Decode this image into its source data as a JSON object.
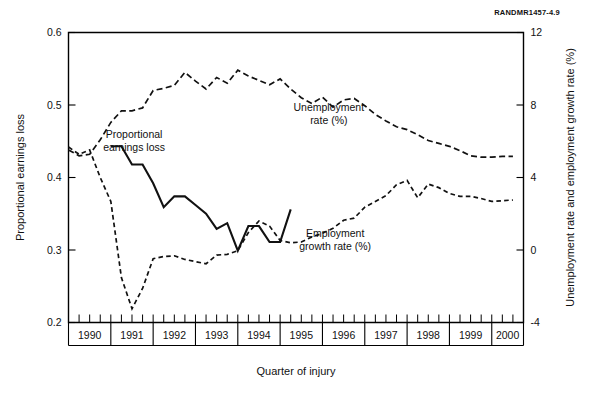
{
  "figure": {
    "number_note": "RANDMR1457-4.9"
  },
  "chart_data": {
    "type": "line",
    "title": "",
    "xlabel": "Quarter of injury",
    "ylabel": "Proportional earnings loss",
    "y2label": "Unemployment rate and employment growth rate (%)",
    "grid": false,
    "legend_position": "inline-annotations",
    "xlim": [
      1990.0,
      2000.75
    ],
    "ylim": [
      0.2,
      0.6
    ],
    "y2lim": [
      -4,
      12
    ],
    "yticks": [
      0.2,
      0.3,
      0.4,
      0.5,
      0.6
    ],
    "ytick_labels": [
      "0.2",
      "0.3",
      "0.4",
      "0.5",
      "0.6"
    ],
    "y2ticks": [
      -4,
      0,
      4,
      8,
      12
    ],
    "y2tick_labels": [
      "-4",
      "0",
      "4",
      "8",
      "12"
    ],
    "x_year_labels": [
      "1990",
      "1991",
      "1992",
      "1993",
      "1994",
      "1995",
      "1996",
      "1997",
      "1998",
      "1999",
      "2000"
    ],
    "x_minor_ticks_per_year": 4,
    "annotations": [
      {
        "text_line1": "Unemployment",
        "text_line2": "rate (%)",
        "x": 1996.15,
        "y_left": 0.492
      },
      {
        "text_line1": "Proportional",
        "text_line2": "earnings loss",
        "x": 1991.55,
        "y_left": 0.455
      },
      {
        "text_line1": "Employment",
        "text_line2": "growth rate (%)",
        "x": 1996.3,
        "y_left": 0.318
      }
    ],
    "series": [
      {
        "name": "Proportional earnings loss",
        "style": "solid",
        "axis": "left",
        "x": [
          1991.0,
          1991.25,
          1991.5,
          1991.75,
          1992.0,
          1992.25,
          1992.5,
          1992.75,
          1993.0,
          1993.25,
          1993.5,
          1993.75,
          1994.0,
          1994.25,
          1994.5,
          1994.75,
          1995.0,
          1995.25
        ],
        "values": [
          0.443,
          0.443,
          0.418,
          0.418,
          0.392,
          0.359,
          0.374,
          0.374,
          0.362,
          0.35,
          0.329,
          0.337,
          0.299,
          0.333,
          0.333,
          0.311,
          0.311,
          0.356
        ]
      },
      {
        "name": "Unemployment rate (%)",
        "style": "dashed",
        "axis": "right",
        "x": [
          1990.0,
          1990.25,
          1990.5,
          1990.75,
          1991.0,
          1991.25,
          1991.5,
          1991.75,
          1992.0,
          1992.25,
          1992.5,
          1992.75,
          1993.0,
          1993.25,
          1993.5,
          1993.75,
          1994.0,
          1994.25,
          1994.5,
          1994.75,
          1995.0,
          1995.25,
          1995.5,
          1995.75,
          1996.0,
          1996.25,
          1996.5,
          1996.75,
          1997.0,
          1997.25,
          1997.5,
          1997.75,
          1998.0,
          1998.25,
          1998.5,
          1998.75,
          1999.0,
          1999.25,
          1999.5,
          1999.75,
          2000.0,
          2000.25,
          2000.5
        ],
        "values_left_scale": [
          0.438,
          0.43,
          0.432,
          0.452,
          0.476,
          0.492,
          0.492,
          0.496,
          0.52,
          0.523,
          0.527,
          0.545,
          0.533,
          0.522,
          0.538,
          0.53,
          0.548,
          0.54,
          0.534,
          0.528,
          0.536,
          0.522,
          0.51,
          0.502,
          0.511,
          0.497,
          0.507,
          0.509,
          0.499,
          0.487,
          0.478,
          0.47,
          0.466,
          0.459,
          0.451,
          0.447,
          0.443,
          0.437,
          0.43,
          0.428,
          0.428,
          0.429,
          0.429
        ],
        "values": [
          5.5,
          5.2,
          5.3,
          6.1,
          7.0,
          7.7,
          7.7,
          7.8,
          8.8,
          8.9,
          9.1,
          9.8,
          9.3,
          8.9,
          9.5,
          9.2,
          9.9,
          9.6,
          9.4,
          9.1,
          9.4,
          8.9,
          8.4,
          8.1,
          8.4,
          7.9,
          8.3,
          8.4,
          8.0,
          7.5,
          7.1,
          6.8,
          6.6,
          6.4,
          6.0,
          5.9,
          5.7,
          5.5,
          5.2,
          5.1,
          5.1,
          5.2,
          5.2
        ]
      },
      {
        "name": "Employment growth rate (%)",
        "style": "dashed-fine",
        "axis": "right",
        "x": [
          1990.0,
          1990.25,
          1990.5,
          1990.75,
          1991.0,
          1991.25,
          1991.5,
          1991.75,
          1992.0,
          1992.25,
          1992.5,
          1992.75,
          1993.0,
          1993.25,
          1993.5,
          1993.75,
          1994.0,
          1994.25,
          1994.5,
          1994.75,
          1995.0,
          1995.25,
          1995.5,
          1995.75,
          1996.0,
          1996.25,
          1996.5,
          1996.75,
          1997.0,
          1997.25,
          1997.5,
          1997.75,
          1998.0,
          1998.25,
          1998.5,
          1998.75,
          1999.0,
          1999.25,
          1999.5,
          1999.75,
          2000.0,
          2000.25,
          2000.5
        ],
        "values_left_scale": [
          0.442,
          0.432,
          0.438,
          0.4,
          0.367,
          0.262,
          0.219,
          0.247,
          0.288,
          0.291,
          0.292,
          0.287,
          0.284,
          0.281,
          0.293,
          0.294,
          0.299,
          0.324,
          0.34,
          0.333,
          0.313,
          0.31,
          0.311,
          0.318,
          0.323,
          0.33,
          0.341,
          0.344,
          0.359,
          0.367,
          0.375,
          0.39,
          0.396,
          0.372,
          0.391,
          0.386,
          0.378,
          0.374,
          0.374,
          0.371,
          0.367,
          0.368,
          0.369
        ],
        "values": [
          5.7,
          5.3,
          5.5,
          4.0,
          2.7,
          -1.5,
          -3.3,
          -2.1,
          -0.5,
          -0.4,
          -0.3,
          -0.5,
          -0.6,
          -0.8,
          -0.3,
          -0.2,
          0.0,
          1.0,
          1.6,
          1.3,
          0.5,
          0.4,
          0.4,
          0.7,
          0.9,
          1.2,
          1.6,
          1.8,
          2.4,
          2.7,
          3.0,
          3.6,
          3.8,
          2.9,
          3.6,
          3.4,
          3.1,
          3.0,
          3.0,
          2.8,
          2.7,
          2.7,
          2.8
        ]
      }
    ]
  }
}
